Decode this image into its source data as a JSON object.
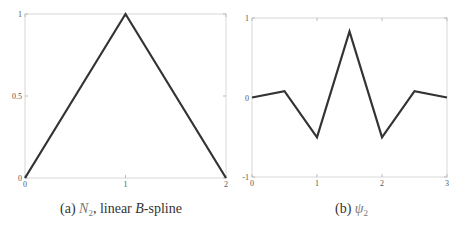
{
  "chart_data": [
    {
      "type": "line",
      "title": "",
      "caption": "(a) N2, linear B-spline",
      "xlabel": "",
      "ylabel": "",
      "xlim": [
        0,
        2
      ],
      "ylim": [
        0,
        1
      ],
      "xticks": [
        0,
        1,
        2
      ],
      "xtick_labels": [
        "0",
        "1",
        "2"
      ],
      "yticks": [
        0,
        0.5,
        1
      ],
      "ytick_labels": [
        "0",
        "0.5",
        "1"
      ],
      "grid": false,
      "series": [
        {
          "name": "N2",
          "x": [
            0,
            1,
            2
          ],
          "y": [
            0,
            1,
            0
          ],
          "color": "#333333"
        }
      ]
    },
    {
      "type": "line",
      "title": "",
      "caption": "(b) ψ2",
      "xlabel": "",
      "ylabel": "",
      "xlim": [
        0,
        3
      ],
      "ylim": [
        -1,
        1
      ],
      "xticks": [
        0,
        1,
        2,
        3
      ],
      "xtick_labels": [
        "0",
        "1",
        "2",
        "3"
      ],
      "yticks": [
        -1,
        0,
        1
      ],
      "ytick_labels": [
        "-1",
        "0",
        "1"
      ],
      "grid": false,
      "series": [
        {
          "name": "ψ2",
          "x": [
            0,
            0.5,
            1,
            1.5,
            2,
            2.5,
            3
          ],
          "y": [
            0,
            0.08,
            -0.5,
            0.83,
            -0.5,
            0.08,
            0
          ],
          "color": "#333333"
        }
      ]
    }
  ],
  "captions": {
    "a": {
      "prefix": "(a) ",
      "symbol": "N",
      "subscript": "2",
      "middle": ", linear ",
      "italic_word": "B",
      "suffix": "-spline"
    },
    "b": {
      "prefix": "(b) ",
      "symbol": "ψ",
      "subscript": "2"
    }
  }
}
